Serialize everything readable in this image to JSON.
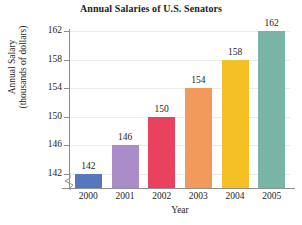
{
  "chart_data": {
    "type": "bar",
    "title": "Annual Salaries of U.S. Senators",
    "xlabel": "Year",
    "ylabel_line1": "Annual Salary",
    "ylabel_line2": "(thousands of dollars)",
    "categories": [
      "2000",
      "2001",
      "2002",
      "2003",
      "2004",
      "2005"
    ],
    "values": [
      142,
      146,
      150,
      154,
      158,
      162
    ],
    "value_labels": [
      "142",
      "146",
      "150",
      "154",
      "158",
      "162"
    ],
    "yticks": [
      142,
      146,
      150,
      154,
      158,
      162
    ],
    "ytick_labels": [
      "142",
      "146",
      "150",
      "154",
      "158",
      "162"
    ],
    "ylim": [
      140,
      162
    ],
    "axis_break": true,
    "grid": true,
    "legend": false,
    "bar_colors": [
      "#5577bb",
      "#a98cc8",
      "#e8425e",
      "#f29a5c",
      "#f5c025",
      "#78b5a7"
    ]
  }
}
